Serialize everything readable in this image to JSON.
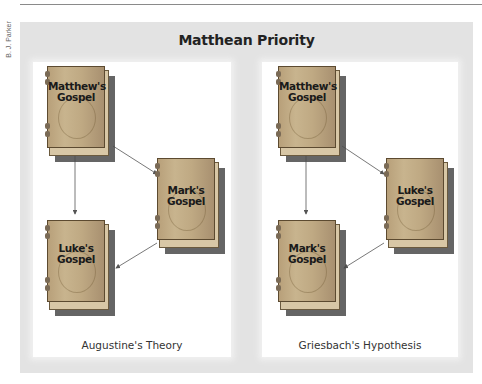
{
  "credit": "B. J. Parker",
  "title": "Matthean Priority",
  "colors": {
    "outer_panel": "#e3e3e3",
    "inner_panel": "#ffffff",
    "book_cover": "#c2ac86",
    "book_shadow": "#4a4a4a",
    "arrow": "#555555"
  },
  "panels": [
    {
      "caption": "Augustine's Theory",
      "books": [
        {
          "line1": "Matthew's",
          "line2": "Gospel"
        },
        {
          "line1": "Mark's",
          "line2": "Gospel"
        },
        {
          "line1": "Luke's",
          "line2": "Gospel"
        }
      ],
      "arrows": [
        "Matthew's Gospel → Mark's Gospel",
        "Matthew's Gospel → Luke's Gospel",
        "Mark's Gospel → Luke's Gospel"
      ]
    },
    {
      "caption": "Griesbach's Hypothesis",
      "books": [
        {
          "line1": "Matthew's",
          "line2": "Gospel"
        },
        {
          "line1": "Luke's",
          "line2": "Gospel"
        },
        {
          "line1": "Mark's",
          "line2": "Gospel"
        }
      ],
      "arrows": [
        "Matthew's Gospel → Luke's Gospel",
        "Matthew's Gospel → Mark's Gospel",
        "Luke's Gospel → Mark's Gospel"
      ]
    }
  ]
}
